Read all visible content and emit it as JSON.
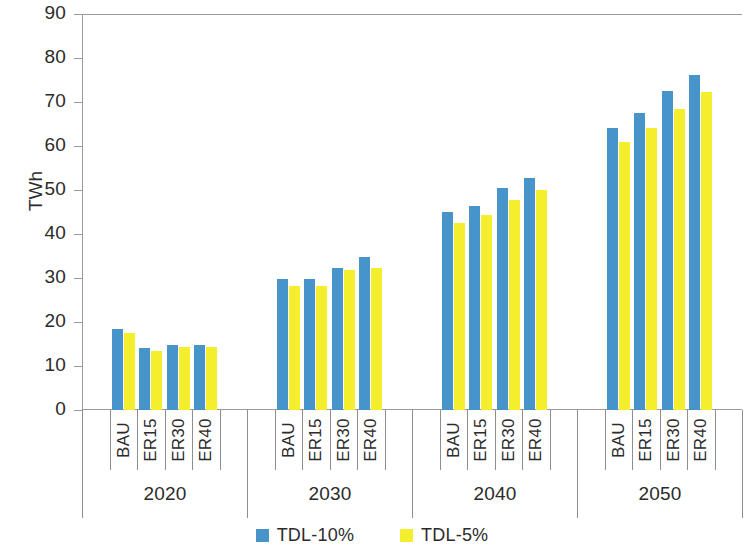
{
  "chart_data": {
    "type": "bar",
    "title": "",
    "xlabel": "",
    "ylabel": "TWh",
    "ylim": [
      0,
      90
    ],
    "yticks": [
      0,
      10,
      20,
      30,
      40,
      50,
      60,
      70,
      80,
      90
    ],
    "grid": false,
    "legend_position": "bottom-center",
    "group_labels": [
      "2020",
      "2030",
      "2040",
      "2050"
    ],
    "categories": [
      "BAU",
      "ER15",
      "ER30",
      "ER40"
    ],
    "series": [
      {
        "name": "TDL-10%",
        "color": "#4794cb",
        "values_by_group": {
          "2020": [
            18.3,
            14.2,
            14.8,
            14.8
          ],
          "2030": [
            29.8,
            29.8,
            32.3,
            34.7
          ],
          "2040": [
            45.0,
            46.4,
            50.5,
            52.7
          ],
          "2050": [
            64.1,
            67.4,
            72.5,
            76.2
          ]
        }
      },
      {
        "name": "TDL-5%",
        "color": "#f4ee2c",
        "values_by_group": {
          "2020": [
            17.6,
            13.5,
            14.3,
            14.3
          ],
          "2030": [
            28.1,
            28.1,
            31.8,
            32.3
          ],
          "2040": [
            42.6,
            44.3,
            47.7,
            50.0
          ],
          "2050": [
            60.8,
            64.0,
            68.5,
            72.2
          ]
        }
      }
    ]
  },
  "axis": {
    "y_title": "TWh",
    "tick_labels": [
      "90",
      "80",
      "70",
      "60",
      "50",
      "40",
      "30",
      "20",
      "10",
      "0"
    ]
  },
  "legend": {
    "items": [
      {
        "label": "TDL-10%",
        "swatch": "blue-swatch-icon"
      },
      {
        "label": "TDL-5%",
        "swatch": "yellow-swatch-icon"
      }
    ]
  }
}
